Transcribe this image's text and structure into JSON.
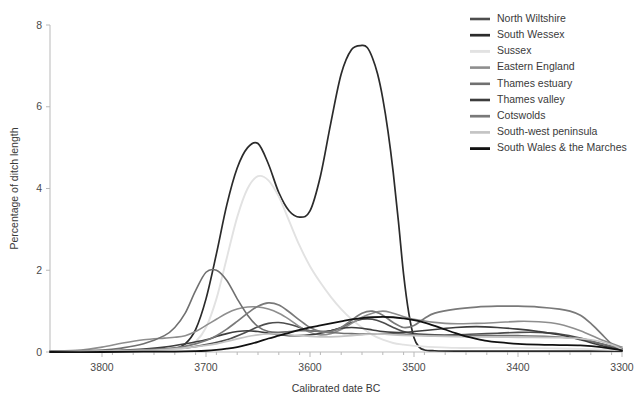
{
  "chart_data": {
    "type": "line",
    "title": "",
    "xlabel": "Calibrated date BC",
    "ylabel": "Percentage of ditch length",
    "xlim": [
      3850,
      3300
    ],
    "ylim": [
      0,
      8
    ],
    "x_ticks": [
      3800,
      3700,
      3600,
      3500,
      3400,
      3300
    ],
    "x_tick_labels": [
      "3800",
      "3700",
      "3600",
      "3500",
      "3400",
      "3300"
    ],
    "y_ticks": [
      0,
      2,
      4,
      6,
      8
    ],
    "y_tick_labels": [
      "0",
      "2",
      "4",
      "6",
      "8"
    ],
    "x_axis_direction": "reversed",
    "grid": false,
    "legend_position": "upper-right",
    "series": [
      {
        "name": "North Wiltshire",
        "color": "#4d4d4d",
        "width": 1.6,
        "x": [
          3850,
          3800,
          3760,
          3720,
          3700,
          3680,
          3660,
          3650,
          3640,
          3630,
          3620,
          3610,
          3600,
          3590,
          3580,
          3570,
          3560,
          3550,
          3540,
          3530,
          3520,
          3510,
          3500,
          3480,
          3460,
          3440,
          3420,
          3400,
          3380,
          3360,
          3340,
          3320,
          3300
        ],
        "y": [
          0.02,
          0.03,
          0.05,
          0.1,
          0.18,
          0.3,
          0.5,
          0.62,
          0.7,
          0.72,
          0.68,
          0.6,
          0.52,
          0.5,
          0.52,
          0.6,
          0.72,
          0.8,
          0.8,
          0.72,
          0.6,
          0.5,
          0.45,
          0.42,
          0.42,
          0.44,
          0.46,
          0.48,
          0.48,
          0.44,
          0.34,
          0.2,
          0.08
        ]
      },
      {
        "name": "South Wessex",
        "color": "#2b2b2b",
        "width": 1.7,
        "x": [
          3850,
          3800,
          3760,
          3740,
          3730,
          3720,
          3710,
          3700,
          3690,
          3680,
          3670,
          3660,
          3650,
          3640,
          3630,
          3620,
          3610,
          3600,
          3590,
          3580,
          3570,
          3560,
          3550,
          3545,
          3540,
          3535,
          3530,
          3525,
          3520,
          3515,
          3510,
          3505,
          3500,
          3495,
          3490,
          3480,
          3460,
          3440,
          3400,
          3350,
          3300
        ],
        "y": [
          0.01,
          0.01,
          0.02,
          0.04,
          0.08,
          0.2,
          0.55,
          1.3,
          2.4,
          3.6,
          4.5,
          5.0,
          5.1,
          4.6,
          3.9,
          3.45,
          3.3,
          3.45,
          4.3,
          5.6,
          6.8,
          7.4,
          7.5,
          7.45,
          7.2,
          6.8,
          6.2,
          5.4,
          4.4,
          3.2,
          1.9,
          0.95,
          0.35,
          0.12,
          0.05,
          0.03,
          0.02,
          0.02,
          0.02,
          0.02,
          0.02
        ]
      },
      {
        "name": "Sussex",
        "color": "#e2e2e2",
        "width": 1.9,
        "x": [
          3850,
          3800,
          3760,
          3730,
          3720,
          3710,
          3700,
          3690,
          3680,
          3670,
          3660,
          3650,
          3640,
          3630,
          3620,
          3610,
          3600,
          3590,
          3580,
          3570,
          3560,
          3550,
          3540,
          3530,
          3520,
          3510,
          3500,
          3480,
          3460,
          3440,
          3400,
          3350,
          3300
        ],
        "y": [
          0.01,
          0.01,
          0.02,
          0.05,
          0.1,
          0.25,
          0.6,
          1.3,
          2.3,
          3.3,
          4.0,
          4.3,
          4.2,
          3.8,
          3.2,
          2.6,
          2.1,
          1.7,
          1.35,
          1.05,
          0.8,
          0.6,
          0.42,
          0.3,
          0.22,
          0.18,
          0.15,
          0.12,
          0.1,
          0.1,
          0.1,
          0.08,
          0.05
        ]
      },
      {
        "name": "Eastern England",
        "color": "#8e8e8e",
        "width": 1.6,
        "x": [
          3850,
          3820,
          3800,
          3780,
          3760,
          3740,
          3730,
          3720,
          3710,
          3700,
          3690,
          3680,
          3670,
          3660,
          3650,
          3640,
          3630,
          3620,
          3610,
          3600,
          3590,
          3580,
          3570,
          3560,
          3550,
          3540,
          3530,
          3520,
          3500,
          3470,
          3440,
          3420,
          3400,
          3380,
          3360,
          3340,
          3320,
          3300
        ],
        "y": [
          0.02,
          0.05,
          0.12,
          0.22,
          0.3,
          0.34,
          0.36,
          0.4,
          0.5,
          0.65,
          0.8,
          0.95,
          1.05,
          1.1,
          1.1,
          1.05,
          0.95,
          0.8,
          0.62,
          0.48,
          0.42,
          0.45,
          0.55,
          0.7,
          0.85,
          0.95,
          1.0,
          0.95,
          0.8,
          0.7,
          0.7,
          0.72,
          0.75,
          0.74,
          0.68,
          0.52,
          0.3,
          0.12
        ]
      },
      {
        "name": "Thames estuary",
        "color": "#707070",
        "width": 1.6,
        "x": [
          3850,
          3800,
          3780,
          3760,
          3740,
          3730,
          3720,
          3710,
          3700,
          3690,
          3680,
          3670,
          3660,
          3650,
          3640,
          3630,
          3620,
          3610,
          3600,
          3590,
          3580,
          3570,
          3560,
          3550,
          3540,
          3530,
          3520,
          3510,
          3500,
          3480,
          3450,
          3420,
          3400,
          3370,
          3340,
          3320,
          3300
        ],
        "y": [
          0.02,
          0.05,
          0.1,
          0.2,
          0.4,
          0.6,
          0.95,
          1.5,
          1.95,
          2.0,
          1.75,
          1.3,
          0.9,
          0.62,
          0.5,
          0.48,
          0.5,
          0.52,
          0.52,
          0.5,
          0.48,
          0.46,
          0.45,
          0.44,
          0.44,
          0.45,
          0.45,
          0.44,
          0.42,
          0.4,
          0.4,
          0.4,
          0.4,
          0.38,
          0.32,
          0.2,
          0.07
        ]
      },
      {
        "name": "Thames valley",
        "color": "#3d3d3d",
        "width": 1.6,
        "x": [
          3850,
          3800,
          3780,
          3760,
          3740,
          3720,
          3700,
          3690,
          3680,
          3670,
          3660,
          3650,
          3640,
          3630,
          3620,
          3610,
          3600,
          3590,
          3580,
          3570,
          3560,
          3550,
          3540,
          3530,
          3520,
          3510,
          3500,
          3480,
          3460,
          3440,
          3420,
          3400,
          3380,
          3360,
          3340,
          3320,
          3300
        ],
        "y": [
          0.01,
          0.02,
          0.04,
          0.07,
          0.12,
          0.2,
          0.3,
          0.38,
          0.45,
          0.5,
          0.52,
          0.5,
          0.46,
          0.42,
          0.4,
          0.4,
          0.42,
          0.46,
          0.52,
          0.58,
          0.6,
          0.58,
          0.54,
          0.5,
          0.48,
          0.48,
          0.5,
          0.55,
          0.6,
          0.62,
          0.6,
          0.56,
          0.5,
          0.42,
          0.3,
          0.16,
          0.05
        ]
      },
      {
        "name": "Cotswolds",
        "color": "#797979",
        "width": 1.7,
        "x": [
          3850,
          3800,
          3760,
          3730,
          3710,
          3700,
          3690,
          3680,
          3670,
          3660,
          3650,
          3640,
          3630,
          3620,
          3610,
          3600,
          3590,
          3580,
          3570,
          3560,
          3550,
          3540,
          3530,
          3520,
          3510,
          3500,
          3490,
          3480,
          3460,
          3440,
          3420,
          3400,
          3380,
          3360,
          3350,
          3340,
          3330,
          3320,
          3310,
          3300
        ],
        "y": [
          0.01,
          0.02,
          0.05,
          0.1,
          0.2,
          0.28,
          0.4,
          0.56,
          0.75,
          0.95,
          1.12,
          1.2,
          1.15,
          0.98,
          0.78,
          0.6,
          0.5,
          0.5,
          0.6,
          0.78,
          0.95,
          1.0,
          0.9,
          0.72,
          0.6,
          0.65,
          0.82,
          0.95,
          1.05,
          1.1,
          1.12,
          1.12,
          1.1,
          1.05,
          1.0,
          0.9,
          0.7,
          0.45,
          0.2,
          0.06
        ]
      },
      {
        "name": "South-west peninsula",
        "color": "#c4c4c4",
        "width": 1.7,
        "x": [
          3850,
          3800,
          3760,
          3740,
          3720,
          3700,
          3690,
          3680,
          3670,
          3660,
          3650,
          3640,
          3630,
          3620,
          3610,
          3600,
          3590,
          3580,
          3570,
          3560,
          3550,
          3540,
          3530,
          3520,
          3500,
          3470,
          3440,
          3400,
          3360,
          3330,
          3310,
          3300
        ],
        "y": [
          0.01,
          0.02,
          0.04,
          0.06,
          0.1,
          0.16,
          0.2,
          0.26,
          0.32,
          0.38,
          0.42,
          0.44,
          0.44,
          0.42,
          0.4,
          0.38,
          0.37,
          0.37,
          0.38,
          0.4,
          0.42,
          0.44,
          0.44,
          0.42,
          0.4,
          0.38,
          0.37,
          0.36,
          0.35,
          0.3,
          0.18,
          0.06
        ]
      },
      {
        "name": "South Wales & the Marches",
        "color": "#111111",
        "width": 1.8,
        "x": [
          3850,
          3800,
          3760,
          3730,
          3710,
          3700,
          3690,
          3680,
          3670,
          3660,
          3650,
          3640,
          3630,
          3620,
          3610,
          3600,
          3590,
          3580,
          3570,
          3560,
          3550,
          3540,
          3530,
          3520,
          3510,
          3500,
          3490,
          3480,
          3470,
          3460,
          3450,
          3440,
          3430,
          3420,
          3400,
          3380,
          3360,
          3340,
          3320,
          3300
        ],
        "y": [
          0.0,
          0.0,
          0.01,
          0.01,
          0.02,
          0.03,
          0.05,
          0.08,
          0.12,
          0.18,
          0.25,
          0.33,
          0.4,
          0.47,
          0.54,
          0.6,
          0.65,
          0.7,
          0.75,
          0.8,
          0.83,
          0.85,
          0.86,
          0.85,
          0.82,
          0.78,
          0.72,
          0.64,
          0.55,
          0.46,
          0.38,
          0.32,
          0.27,
          0.24,
          0.2,
          0.18,
          0.17,
          0.16,
          0.12,
          0.04
        ]
      }
    ]
  },
  "legend": {
    "items": [
      {
        "label": "North Wiltshire"
      },
      {
        "label": "South Wessex"
      },
      {
        "label": "Sussex"
      },
      {
        "label": "Eastern England"
      },
      {
        "label": "Thames estuary"
      },
      {
        "label": "Thames valley"
      },
      {
        "label": "Cotswolds"
      },
      {
        "label": "South-west peninsula"
      },
      {
        "label": "South Wales & the Marches"
      }
    ]
  }
}
